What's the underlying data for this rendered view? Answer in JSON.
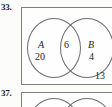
{
  "page": {
    "background_color": "#fcfcfb",
    "ink_color": "#1c1c1c",
    "rule_color": "#7e7e7e"
  },
  "exercises": [
    {
      "number": "33.",
      "diagram": {
        "type": "venn-two-set",
        "universe_label": "",
        "sets": [
          {
            "letter": "A",
            "count": "20"
          },
          {
            "letter": "B",
            "count": "4"
          }
        ],
        "intersection_count": "6",
        "outside_count": "13"
      }
    },
    {
      "number": "37.",
      "diagram": {
        "type": "venn-two-set",
        "sets": [],
        "intersection_count": "",
        "outside_count": ""
      }
    }
  ],
  "chart_data": {
    "type": "venn",
    "categories": [
      "A only",
      "A and B",
      "B only",
      "Outside"
    ],
    "values": [
      20,
      6,
      4,
      13
    ],
    "labels": [
      "A",
      "B"
    ],
    "legend": "none",
    "grid": false
  }
}
